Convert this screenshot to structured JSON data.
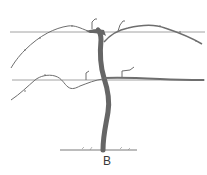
{
  "figure": {
    "label": "B",
    "colors": {
      "wire": "#8a8a8a",
      "vine": "#6e6e6e",
      "trunk": "#666666",
      "background": "#ffffff"
    }
  }
}
